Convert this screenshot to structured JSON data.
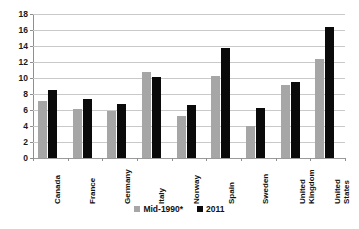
{
  "chart_data": {
    "type": "bar",
    "title": "",
    "subtitle": "",
    "xlabel": "",
    "ylabel": "",
    "ylim": [
      0,
      18
    ],
    "ytick_step": 2,
    "yticks": [
      "18",
      "16",
      "14",
      "12",
      "10",
      "8",
      "6",
      "4",
      "2",
      "0"
    ],
    "grid": true,
    "legend_position": "bottom",
    "categories": [
      "Canada",
      "France",
      "Germany",
      "Italy",
      "Norway",
      "Spain",
      "Sweden",
      "United\nKingdom",
      "United\nStates"
    ],
    "series": [
      {
        "name": "Mid-1990*",
        "color": "#a6a6a6",
        "values": [
          7.1,
          6.1,
          5.9,
          10.8,
          5.3,
          10.3,
          4.0,
          9.1,
          12.4
        ]
      },
      {
        "name": "2011",
        "color": "#0a0a0a",
        "values": [
          8.5,
          7.4,
          6.8,
          10.1,
          6.6,
          13.8,
          6.2,
          9.5,
          16.4
        ]
      }
    ]
  },
  "legend": {
    "items": [
      {
        "label": "Mid-1990*",
        "swatch": "legend-swatch-gray"
      },
      {
        "label": "2011",
        "swatch": "legend-swatch-black"
      }
    ]
  }
}
